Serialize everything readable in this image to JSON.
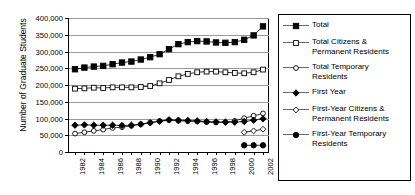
{
  "chart_data": {
    "type": "line",
    "title": "",
    "xlabel": "",
    "ylabel": "Number of Graduate Students",
    "ylim": [
      0,
      400000
    ],
    "ytick_values": [
      0,
      50000,
      100000,
      150000,
      200000,
      250000,
      300000,
      350000,
      400000
    ],
    "ytick_labels": [
      "0",
      "50,000",
      "100,000",
      "150,000",
      "200,000",
      "250,000",
      "300,000",
      "350,000",
      "400,000"
    ],
    "grid": true,
    "legend_position": "right",
    "x": [
      1982,
      1983,
      1984,
      1985,
      1986,
      1987,
      1988,
      1989,
      1990,
      1991,
      1992,
      1993,
      1994,
      1995,
      1996,
      1997,
      1998,
      1999,
      2000,
      2001,
      2002
    ],
    "xtick_labels": [
      "1982",
      "1984",
      "1986",
      "1988",
      "1990",
      "1992",
      "1994",
      "1996",
      "1998",
      "2000",
      "2002"
    ],
    "xtick_values": [
      1982,
      1984,
      1986,
      1988,
      1990,
      1992,
      1994,
      1996,
      1998,
      2000,
      2002
    ],
    "series": [
      {
        "name": "Total",
        "marker": "filled-square",
        "values": [
          247000,
          252000,
          255000,
          257000,
          262000,
          267000,
          270000,
          276000,
          283000,
          292000,
          307000,
          322000,
          328000,
          331000,
          330000,
          327000,
          326000,
          328000,
          335000,
          348000,
          375000
        ]
      },
      {
        "name": "Total Citizens & Permanent Residents",
        "marker": "open-square",
        "values": [
          189000,
          190000,
          192000,
          191000,
          193000,
          193000,
          193000,
          194000,
          197000,
          205000,
          215000,
          226000,
          233000,
          238000,
          240000,
          240000,
          238000,
          236000,
          235000,
          238000,
          246000
        ]
      },
      {
        "name": "Total Temporary Residents",
        "marker": "open-circle",
        "values": [
          55000,
          59000,
          63000,
          67000,
          72000,
          74000,
          78000,
          83000,
          88000,
          92000,
          95000,
          93000,
          92000,
          91000,
          89000,
          88000,
          89000,
          93000,
          101000,
          108000,
          115000
        ]
      },
      {
        "name": "First Year",
        "marker": "filled-diamond",
        "values": [
          80000,
          81000,
          80000,
          80000,
          80000,
          79000,
          80000,
          83000,
          87000,
          92000,
          96000,
          95000,
          94000,
          93000,
          91000,
          90000,
          89000,
          89000,
          91000,
          95000,
          99000
        ]
      },
      {
        "name": "First-Year Citizens & Permanent Residents",
        "marker": "open-diamond",
        "values": [
          null,
          null,
          null,
          null,
          null,
          null,
          null,
          null,
          null,
          null,
          null,
          null,
          null,
          null,
          null,
          null,
          null,
          null,
          59000,
          63000,
          68000
        ]
      },
      {
        "name": "First-Year Temporary Residents",
        "marker": "filled-circle",
        "values": [
          null,
          null,
          null,
          null,
          null,
          null,
          null,
          null,
          null,
          null,
          null,
          null,
          null,
          null,
          null,
          null,
          null,
          null,
          20000,
          20000,
          20000
        ]
      }
    ]
  },
  "legend": {
    "items": [
      {
        "label": "Total",
        "marker": "filled-square"
      },
      {
        "label": "Total Citizens &\nPermanent Residents",
        "marker": "open-square"
      },
      {
        "label": "Total Temporary\nResidents",
        "marker": "open-circle"
      },
      {
        "label": "First Year",
        "marker": "filled-diamond"
      },
      {
        "label": "First-Year Citizens &\nPermanent Residents",
        "marker": "open-diamond"
      },
      {
        "label": "First-Year Temporary\nResidents",
        "marker": "filled-circle"
      }
    ]
  },
  "colors": {
    "series_line": "#000000",
    "grid": "#9a9a9a",
    "axis": "#000000",
    "background": "#ffffff"
  }
}
